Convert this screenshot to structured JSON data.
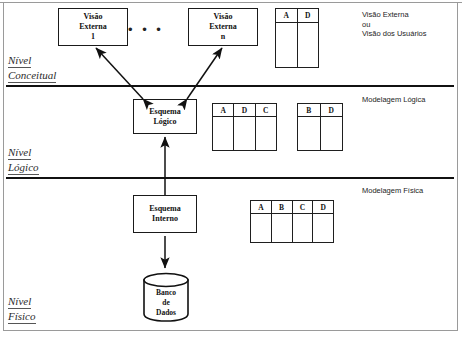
{
  "diagram": {
    "levels": [
      {
        "id": "conceitual",
        "line1": "Nível",
        "line2": "Conceitual"
      },
      {
        "id": "logico",
        "line1": "Nível",
        "line2": "Lógico"
      },
      {
        "id": "fisico",
        "line1": "Nível",
        "line2": "Físico"
      }
    ],
    "boxes": [
      {
        "id": "visao-externa-1",
        "line1": "Visão",
        "line2": "Externa",
        "line3": "1"
      },
      {
        "id": "visao-externa-n",
        "line1": "Visão",
        "line2": "Externa",
        "line3": "n"
      },
      {
        "id": "esquema-logico",
        "line1": "Esquema",
        "line2": "Lógico",
        "line3": ""
      },
      {
        "id": "esquema-interno",
        "line1": "Esquema",
        "line2": "Interno",
        "line3": ""
      }
    ],
    "ellipsis": "• • •",
    "database": {
      "line1": "Banco",
      "line2": "de",
      "line3": "Dados"
    },
    "tables": [
      {
        "id": "tabela-externa",
        "columns": [
          "A",
          "D"
        ]
      },
      {
        "id": "tabela-logica-1",
        "columns": [
          "A",
          "D",
          "C"
        ]
      },
      {
        "id": "tabela-logica-2",
        "columns": [
          "B",
          "D"
        ]
      },
      {
        "id": "tabela-fisica",
        "columns": [
          "A",
          "B",
          "C",
          "D"
        ]
      }
    ],
    "annotations": [
      {
        "id": "visao-externa-usuarios",
        "lines": [
          "Visão Externa",
          "ou",
          "Visão dos Usuários"
        ]
      },
      {
        "id": "modelagem-logica",
        "lines": [
          "Modelagem Lógica"
        ]
      },
      {
        "id": "modelagem-fisica",
        "lines": [
          "Modelagem Física"
        ]
      }
    ],
    "colors": {
      "ink": "#111111",
      "rule": "#111111",
      "frame": "#9a9a9a",
      "paper": "#ffffff"
    }
  }
}
